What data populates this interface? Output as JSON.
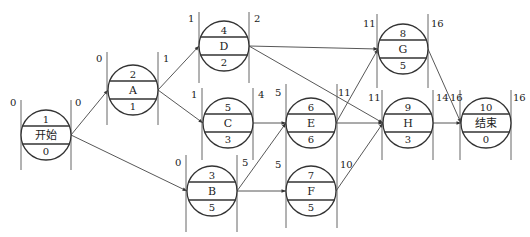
{
  "diagram": {
    "type": "activity-on-node network (single-code network plan)",
    "nodes": [
      {
        "id": "start",
        "code": "1",
        "label": "开始",
        "duration": "0",
        "es": "0",
        "ef": "0",
        "cx": 46,
        "cy": 135,
        "lx1": 21,
        "lx2": 71,
        "ly1": 100,
        "ly2": 170,
        "es_pos": [
          10,
          106
        ],
        "ef_pos": [
          75,
          106
        ]
      },
      {
        "id": "A",
        "code": "2",
        "label": "A",
        "duration": "1",
        "es": "0",
        "ef": "1",
        "cx": 133,
        "cy": 90,
        "lx1": 107,
        "lx2": 158,
        "ly1": 52,
        "ly2": 125,
        "es_pos": [
          96,
          62
        ],
        "ef_pos": [
          163,
          62
        ]
      },
      {
        "id": "D",
        "code": "4",
        "label": "D",
        "duration": "2",
        "es": "1",
        "ef": "2",
        "cx": 224,
        "cy": 46,
        "lx1": 199,
        "lx2": 249,
        "ly1": 12,
        "ly2": 83,
        "es_pos": [
          188,
          22
        ],
        "ef_pos": [
          254,
          22
        ]
      },
      {
        "id": "C",
        "code": "5",
        "label": "C",
        "duration": "3",
        "es": "1",
        "ef": "4",
        "cx": 228,
        "cy": 123,
        "lx1": 202,
        "lx2": 253,
        "ly1": 88,
        "ly2": 160,
        "es_pos": [
          191,
          98
        ],
        "ef_pos": [
          258,
          98
        ]
      },
      {
        "id": "B",
        "code": "3",
        "label": "B",
        "duration": "5",
        "es": "0",
        "ef": "5",
        "cx": 212,
        "cy": 191,
        "lx1": 186,
        "lx2": 237,
        "ly1": 155,
        "ly2": 232,
        "es_pos": [
          175,
          166
        ],
        "ef_pos": [
          242,
          166
        ]
      },
      {
        "id": "E",
        "code": "6",
        "label": "E",
        "duration": "6",
        "es": "5",
        "ef": "11",
        "cx": 311,
        "cy": 123,
        "lx1": 286,
        "lx2": 337,
        "ly1": 84,
        "ly2": 160,
        "es_pos": [
          275,
          96
        ],
        "ef_pos": [
          338,
          96
        ]
      },
      {
        "id": "F",
        "code": "7",
        "label": "F",
        "duration": "5",
        "es": "5",
        "ef": "10",
        "cx": 311,
        "cy": 191,
        "lx1": 286,
        "lx2": 337,
        "ly1": 160,
        "ly2": 228,
        "es_pos": [
          275,
          168
        ],
        "ef_pos": [
          340,
          168
        ]
      },
      {
        "id": "G",
        "code": "8",
        "label": "G",
        "duration": "5",
        "es": "11",
        "ef": "16",
        "cx": 403,
        "cy": 49,
        "lx1": 377,
        "lx2": 428,
        "ly1": 14,
        "ly2": 88,
        "es_pos": [
          363,
          27
        ],
        "ef_pos": [
          431,
          27
        ]
      },
      {
        "id": "H",
        "code": "9",
        "label": "H",
        "duration": "3",
        "es": "11",
        "ef": "14",
        "cx": 408,
        "cy": 123,
        "lx1": 382,
        "lx2": 433,
        "ly1": 90,
        "ly2": 160,
        "es_pos": [
          368,
          101
        ],
        "ef_pos": [
          436,
          101
        ]
      },
      {
        "id": "end",
        "code": "10",
        "label": "结束",
        "duration": "0",
        "es": "16",
        "ef": "16",
        "cx": 486,
        "cy": 123,
        "lx1": 460,
        "lx2": 511,
        "ly1": 90,
        "ly2": 160,
        "es_pos": [
          450,
          101
        ],
        "ef_pos": [
          513,
          101
        ]
      }
    ],
    "edges": [
      {
        "from": "start",
        "to": "A"
      },
      {
        "from": "start",
        "to": "B"
      },
      {
        "from": "A",
        "to": "D"
      },
      {
        "from": "A",
        "to": "C"
      },
      {
        "from": "D",
        "to": "G"
      },
      {
        "from": "D",
        "to": "H"
      },
      {
        "from": "C",
        "to": "E"
      },
      {
        "from": "B",
        "to": "E"
      },
      {
        "from": "B",
        "to": "F"
      },
      {
        "from": "E",
        "to": "G"
      },
      {
        "from": "E",
        "to": "H"
      },
      {
        "from": "F",
        "to": "H"
      },
      {
        "from": "G",
        "to": "end"
      },
      {
        "from": "H",
        "to": "end"
      }
    ],
    "radius": 25,
    "colors": {
      "stroke": "#333333",
      "text": "#222222",
      "background": "#ffffff"
    }
  }
}
